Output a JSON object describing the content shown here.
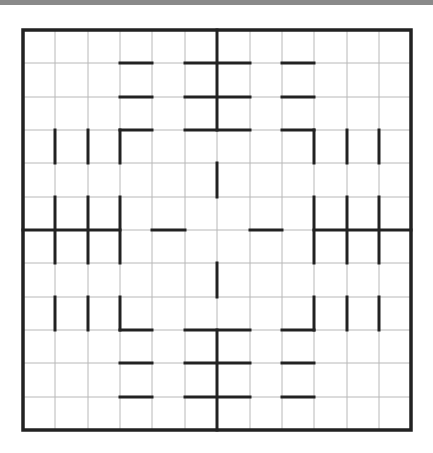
{
  "puzzle": {
    "type": "grid-region-puzzle",
    "rows": 12,
    "cols": 12,
    "colors": {
      "background": "#ffffff",
      "thin_line": "#b8b8b8",
      "thick_line": "#222222",
      "top_bar": "#8a8a8a"
    },
    "geometry": {
      "x_lines": [
        23,
        55,
        88,
        120,
        152,
        185,
        217,
        250,
        282,
        314,
        347,
        379,
        411
      ],
      "y_lines": [
        30,
        63,
        97,
        130,
        163,
        197,
        230,
        263,
        297,
        330,
        363,
        397,
        430
      ]
    },
    "thick_horizontal": [
      {
        "row": 1,
        "from": 3,
        "to": 4
      },
      {
        "row": 1,
        "from": 5,
        "to": 7
      },
      {
        "row": 1,
        "from": 8,
        "to": 9
      },
      {
        "row": 2,
        "from": 3,
        "to": 4
      },
      {
        "row": 2,
        "from": 5,
        "to": 7
      },
      {
        "row": 2,
        "from": 8,
        "to": 9
      },
      {
        "row": 3,
        "from": 3,
        "to": 4
      },
      {
        "row": 3,
        "from": 5,
        "to": 7
      },
      {
        "row": 3,
        "from": 8,
        "to": 9
      },
      {
        "row": 6,
        "from": 0,
        "to": 3
      },
      {
        "row": 6,
        "from": 4,
        "to": 5
      },
      {
        "row": 6,
        "from": 7,
        "to": 8
      },
      {
        "row": 6,
        "from": 9,
        "to": 12
      },
      {
        "row": 9,
        "from": 3,
        "to": 4
      },
      {
        "row": 9,
        "from": 5,
        "to": 7
      },
      {
        "row": 9,
        "from": 8,
        "to": 9
      },
      {
        "row": 10,
        "from": 3,
        "to": 4
      },
      {
        "row": 10,
        "from": 5,
        "to": 7
      },
      {
        "row": 10,
        "from": 8,
        "to": 9
      },
      {
        "row": 11,
        "from": 3,
        "to": 4
      },
      {
        "row": 11,
        "from": 5,
        "to": 7
      },
      {
        "row": 11,
        "from": 8,
        "to": 9
      }
    ],
    "thick_vertical": [
      {
        "col": 6,
        "from": 0,
        "to": 3
      },
      {
        "col": 6,
        "from": 4,
        "to": 5
      },
      {
        "col": 6,
        "from": 7,
        "to": 8
      },
      {
        "col": 6,
        "from": 9,
        "to": 12
      },
      {
        "col": 1,
        "from": 3,
        "to": 4
      },
      {
        "col": 1,
        "from": 5,
        "to": 7
      },
      {
        "col": 1,
        "from": 8,
        "to": 9
      },
      {
        "col": 2,
        "from": 3,
        "to": 4
      },
      {
        "col": 2,
        "from": 5,
        "to": 7
      },
      {
        "col": 2,
        "from": 8,
        "to": 9
      },
      {
        "col": 3,
        "from": 3,
        "to": 4
      },
      {
        "col": 3,
        "from": 5,
        "to": 7
      },
      {
        "col": 3,
        "from": 8,
        "to": 9
      },
      {
        "col": 9,
        "from": 3,
        "to": 4
      },
      {
        "col": 9,
        "from": 5,
        "to": 7
      },
      {
        "col": 9,
        "from": 8,
        "to": 9
      },
      {
        "col": 10,
        "from": 3,
        "to": 4
      },
      {
        "col": 10,
        "from": 5,
        "to": 7
      },
      {
        "col": 10,
        "from": 8,
        "to": 9
      },
      {
        "col": 11,
        "from": 3,
        "to": 4
      },
      {
        "col": 11,
        "from": 5,
        "to": 7
      },
      {
        "col": 11,
        "from": 8,
        "to": 9
      }
    ]
  }
}
